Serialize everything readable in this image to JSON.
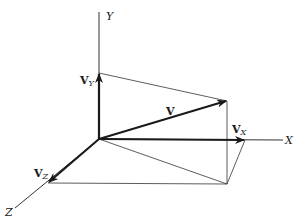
{
  "diagram": {
    "axes": {
      "x": {
        "label": "X"
      },
      "y": {
        "label": "Y"
      },
      "z": {
        "label": "Z"
      }
    },
    "vectors": {
      "v": {
        "label": "V"
      },
      "vx": {
        "label": "V",
        "subscript": "X"
      },
      "vy": {
        "label": "V",
        "subscript": "Y"
      },
      "vz": {
        "label": "V",
        "subscript": "Z"
      }
    },
    "colors": {
      "stroke": "#1a1a1a",
      "thin_stroke": "#333333",
      "background": "#ffffff"
    }
  }
}
